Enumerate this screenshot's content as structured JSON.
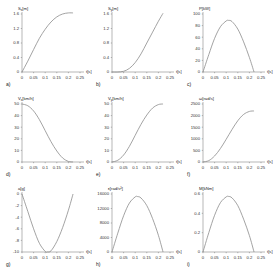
{
  "chart_data": [
    {
      "id": "a",
      "type": "line",
      "letter": "a)",
      "ylabel": "S_x[m]",
      "xlabel": "t[s]",
      "xticks": [
        "0",
        "0.05",
        "0.1",
        "0.15",
        "0.2",
        "0.25"
      ],
      "yticks": [
        "0",
        "0.4",
        "0.8",
        "1.2",
        "1.6"
      ],
      "xlim": [
        0,
        0.25
      ],
      "ylim": [
        0,
        1.6
      ],
      "x": [
        0,
        0.025,
        0.05,
        0.075,
        0.1,
        0.125,
        0.15,
        0.175,
        0.2,
        0.22
      ],
      "y": [
        0,
        0.3,
        0.62,
        0.93,
        1.18,
        1.38,
        1.52,
        1.6,
        1.63,
        1.63
      ]
    },
    {
      "id": "b",
      "type": "line",
      "letter": "b)",
      "ylabel": "S_y[m]",
      "xlabel": "t[s]",
      "xticks": [
        "0",
        "0.05",
        "0.1",
        "0.15",
        "0.2",
        "0.25"
      ],
      "yticks": [
        "0",
        "0.4",
        "0.8",
        "1.2",
        "1.6"
      ],
      "xlim": [
        0,
        0.25
      ],
      "ylim": [
        0,
        1.6
      ],
      "x": [
        0,
        0.025,
        0.05,
        0.075,
        0.1,
        0.125,
        0.15,
        0.175,
        0.2,
        0.22
      ],
      "y": [
        0,
        0.0,
        0.02,
        0.1,
        0.26,
        0.5,
        0.8,
        1.1,
        1.4,
        1.62
      ]
    },
    {
      "id": "c",
      "type": "line",
      "letter": "c)",
      "ylabel": "P[kW]",
      "xlabel": "t[s]",
      "xticks": [
        "0",
        "0.05",
        "0.1",
        "0.15",
        "0.2",
        "0.25"
      ],
      "yticks": [
        "0",
        "20",
        "40",
        "60",
        "80",
        "100"
      ],
      "xlim": [
        0,
        0.25
      ],
      "ylim": [
        0,
        100
      ],
      "x": [
        0,
        0.025,
        0.05,
        0.075,
        0.1,
        0.11,
        0.125,
        0.15,
        0.175,
        0.2,
        0.22
      ],
      "y": [
        0,
        30,
        58,
        78,
        88,
        89,
        87,
        74,
        52,
        25,
        0
      ]
    },
    {
      "id": "d",
      "type": "line",
      "letter": "d)",
      "ylabel": "V_x[km/h]",
      "xlabel": "t[s]",
      "xticks": [
        "0",
        "0.05",
        "0.1",
        "0.15",
        "0.2",
        "0.25"
      ],
      "yticks": [
        "0",
        "10",
        "20",
        "30",
        "40",
        "50"
      ],
      "xlim": [
        0,
        0.25
      ],
      "ylim": [
        0,
        50
      ],
      "x": [
        0,
        0.025,
        0.05,
        0.075,
        0.1,
        0.125,
        0.15,
        0.175,
        0.2,
        0.22
      ],
      "y": [
        50,
        48.5,
        44,
        36.5,
        27,
        17.5,
        9.5,
        3.5,
        0.5,
        0
      ]
    },
    {
      "id": "e",
      "type": "line",
      "letter": "e)",
      "ylabel": "V_y[km/h]",
      "xlabel": "t[s]",
      "xticks": [
        "0",
        "0.05",
        "0.1",
        "0.15",
        "0.2",
        "0.25"
      ],
      "yticks": [
        "0",
        "10",
        "20",
        "30",
        "40",
        "50"
      ],
      "xlim": [
        0,
        0.25
      ],
      "ylim": [
        0,
        50
      ],
      "x": [
        0,
        0.025,
        0.05,
        0.075,
        0.1,
        0.125,
        0.15,
        0.175,
        0.2,
        0.22
      ],
      "y": [
        0,
        1.5,
        6,
        13.5,
        23,
        32.5,
        40.5,
        46.5,
        49.5,
        50
      ]
    },
    {
      "id": "f",
      "type": "line",
      "letter": "f)",
      "ylabel": "ω[rad/s]",
      "xlabel": "t[s]",
      "xticks": [
        "0",
        "0.05",
        "0.1",
        "0.15",
        "0.2",
        "0.25"
      ],
      "yticks": [
        "0",
        "500",
        "1000",
        "1500",
        "2000",
        "2500"
      ],
      "xlim": [
        0,
        0.25
      ],
      "ylim": [
        0,
        2500
      ],
      "x": [
        0,
        0.025,
        0.05,
        0.075,
        0.1,
        0.125,
        0.15,
        0.175,
        0.2,
        0.22
      ],
      "y": [
        0,
        60,
        260,
        580,
        980,
        1400,
        1780,
        2050,
        2180,
        2200
      ]
    },
    {
      "id": "g",
      "type": "line",
      "letter": "g)",
      "ylabel": "a[g]",
      "xlabel": "t[s]",
      "xticks": [
        "0",
        "0.05",
        "0.1",
        "0.15",
        "0.2",
        "0.25"
      ],
      "yticks": [
        "-10",
        "-8",
        "-6",
        "-4",
        "-2",
        "0"
      ],
      "xlim": [
        0,
        0.25
      ],
      "ylim": [
        -10,
        0
      ],
      "x": [
        0,
        0.025,
        0.05,
        0.075,
        0.1,
        0.11,
        0.125,
        0.15,
        0.175,
        0.2,
        0.22
      ],
      "y": [
        0,
        -3,
        -6,
        -8.5,
        -9.9,
        -10,
        -9.8,
        -8.2,
        -5.8,
        -2.8,
        0
      ]
    },
    {
      "id": "h",
      "type": "line",
      "letter": "h)",
      "ylabel": "ε[rad/s²]",
      "xlabel": "t[s]",
      "xticks": [
        "0",
        "0.05",
        "0.1",
        "0.15",
        "0.2",
        "0.25"
      ],
      "yticks": [
        "0",
        "4000",
        "8000",
        "12000",
        "16000"
      ],
      "xlim": [
        0,
        0.25
      ],
      "ylim": [
        0,
        16000
      ],
      "x": [
        0,
        0.025,
        0.05,
        0.075,
        0.1,
        0.11,
        0.125,
        0.15,
        0.175,
        0.2,
        0.22
      ],
      "y": [
        0,
        5200,
        10000,
        13500,
        15200,
        15300,
        14900,
        12800,
        9200,
        4600,
        0
      ]
    },
    {
      "id": "i",
      "type": "line",
      "letter": "i)",
      "ylabel": "M[kNm]",
      "xlabel": "t[s]",
      "xticks": [
        "0",
        "0.05",
        "0.1",
        "0.15",
        "0.2",
        "0.25"
      ],
      "yticks": [
        "0",
        "0.2",
        "0.4",
        "0.6"
      ],
      "xlim": [
        0,
        0.25
      ],
      "ylim": [
        0,
        0.6
      ],
      "x": [
        0,
        0.025,
        0.05,
        0.075,
        0.1,
        0.11,
        0.125,
        0.15,
        0.175,
        0.2,
        0.22
      ],
      "y": [
        0,
        0.2,
        0.38,
        0.51,
        0.57,
        0.575,
        0.56,
        0.48,
        0.34,
        0.17,
        0
      ]
    }
  ]
}
